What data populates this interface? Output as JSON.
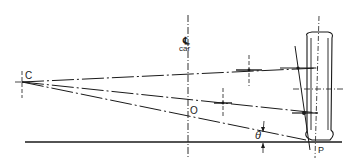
{
  "diagram": {
    "labels": {
      "center": "C",
      "centerline_symbol": "℄",
      "centerline_text": "car",
      "roll_center": "O",
      "angle": "θ",
      "contact_patch": "P"
    },
    "colors": {
      "ink": "#1a1a1a",
      "background": "#ffffff"
    }
  }
}
